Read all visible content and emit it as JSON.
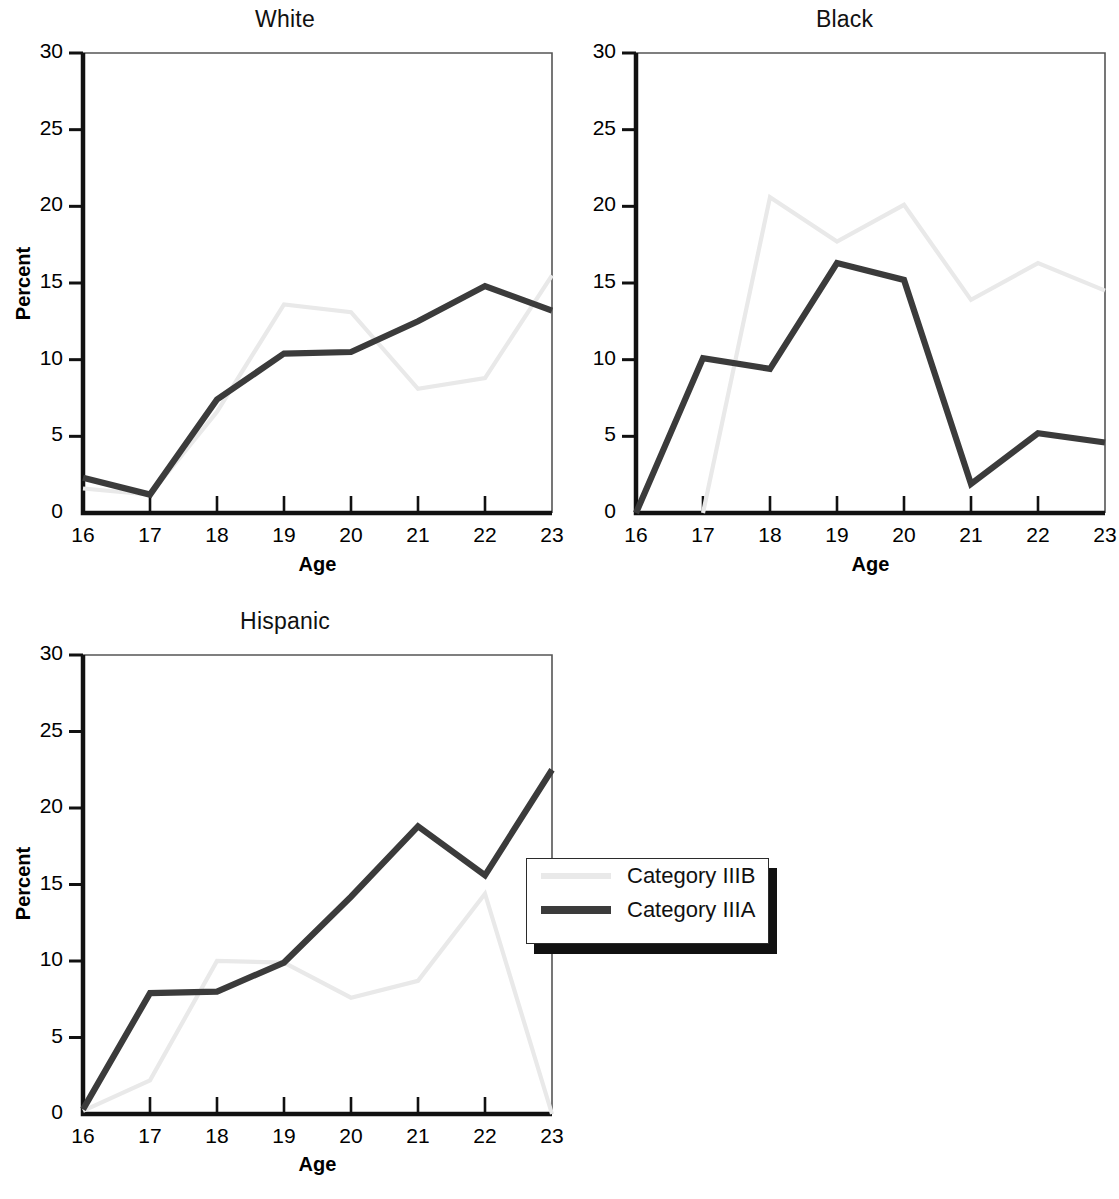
{
  "figure": {
    "axis_title_x": "Age",
    "axis_title_y": "Percent",
    "y_ticks": [
      "0",
      "5",
      "10",
      "15",
      "20",
      "25",
      "30"
    ],
    "x_ticks": [
      "16",
      "17",
      "18",
      "19",
      "20",
      "21",
      "22",
      "23"
    ]
  },
  "legend": {
    "position": "overlapping-hispanic-panel-right",
    "entries": [
      {
        "label": "Category IIIB",
        "color": "#e9e9e9"
      },
      {
        "label": "Category IIIA",
        "color": "#3b3b3b"
      }
    ]
  },
  "panels": [
    {
      "id": "white",
      "title": "White"
    },
    {
      "id": "black",
      "title": "Black"
    },
    {
      "id": "hispanic",
      "title": "Hispanic"
    }
  ],
  "colors": {
    "category_iiib": "#e9e9e9",
    "category_iiia": "#3b3b3b",
    "axis": "#111111",
    "background": "#ffffff"
  },
  "chart_data": [
    {
      "type": "line",
      "title": "White",
      "xlabel": "Age",
      "ylabel": "Percent",
      "x": [
        16,
        17,
        18,
        19,
        20,
        21,
        22,
        23
      ],
      "xlim": [
        16,
        23
      ],
      "ylim": [
        0,
        30
      ],
      "yticks": [
        0,
        5,
        10,
        15,
        20,
        25,
        30
      ],
      "grid": false,
      "legend_position": "none",
      "series": [
        {
          "name": "Category IIIB",
          "color": "#e9e9e9",
          "values": [
            1.6,
            1.2,
            6.6,
            13.6,
            13.1,
            8.1,
            8.8,
            15.5
          ]
        },
        {
          "name": "Category IIIA",
          "color": "#3b3b3b",
          "values": [
            2.3,
            1.2,
            7.4,
            10.4,
            10.5,
            12.5,
            14.8,
            13.2
          ]
        }
      ]
    },
    {
      "type": "line",
      "title": "Black",
      "xlabel": "Age",
      "ylabel": "Percent",
      "x": [
        16,
        17,
        18,
        19,
        20,
        21,
        22,
        23
      ],
      "xlim": [
        16,
        23
      ],
      "ylim": [
        0,
        30
      ],
      "yticks": [
        0,
        5,
        10,
        15,
        20,
        25,
        30
      ],
      "grid": false,
      "legend_position": "none",
      "series": [
        {
          "name": "Category IIIB",
          "color": "#e9e9e9",
          "values": [
            null,
            0.0,
            20.6,
            17.7,
            20.1,
            13.9,
            16.3,
            14.5
          ]
        },
        {
          "name": "Category IIIA",
          "color": "#3b3b3b",
          "values": [
            0.0,
            10.1,
            9.4,
            16.3,
            15.2,
            1.9,
            5.2,
            4.6
          ]
        }
      ]
    },
    {
      "type": "line",
      "title": "Hispanic",
      "xlabel": "Age",
      "ylabel": "Percent",
      "x": [
        16,
        17,
        18,
        19,
        20,
        21,
        22,
        23
      ],
      "xlim": [
        16,
        23
      ],
      "ylim": [
        0,
        30
      ],
      "yticks": [
        0,
        5,
        10,
        15,
        20,
        25,
        30
      ],
      "grid": false,
      "legend_position": "inside-right",
      "series": [
        {
          "name": "Category IIIB",
          "color": "#e9e9e9",
          "values": [
            0.2,
            2.2,
            10.0,
            9.9,
            7.6,
            8.7,
            14.4,
            0.0
          ]
        },
        {
          "name": "Category IIIA",
          "color": "#3b3b3b",
          "values": [
            0.3,
            7.9,
            8.0,
            9.9,
            14.2,
            18.8,
            15.6,
            22.5
          ]
        }
      ]
    }
  ]
}
